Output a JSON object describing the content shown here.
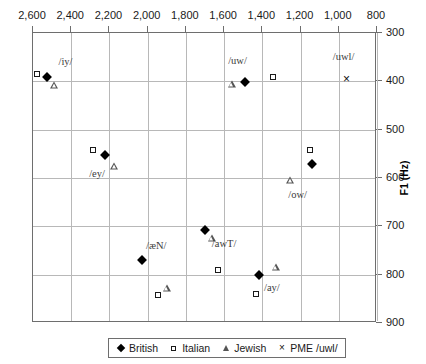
{
  "chart_data": {
    "type": "scatter",
    "title": "",
    "xlabel": "",
    "ylabel": "F1 (Hz)",
    "xlim": [
      2600,
      800
    ],
    "ylim": [
      300,
      900
    ],
    "x_ticks": [
      "2,600",
      "2,400",
      "2,200",
      "2,000",
      "1,800",
      "1,600",
      "1,400",
      "1,200",
      "1,000",
      "800"
    ],
    "x_tick_values": [
      2600,
      2400,
      2200,
      2000,
      1800,
      1600,
      1400,
      1200,
      1000,
      800
    ],
    "y_ticks": [
      "300",
      "400",
      "500",
      "600",
      "700",
      "800",
      "900"
    ],
    "y_tick_values": [
      300,
      400,
      500,
      600,
      700,
      800,
      900
    ],
    "x_axis_position": "top",
    "y_axis_position": "right",
    "x_axis_reversed": true,
    "y_axis_reversed": true,
    "grid": true,
    "legend_position": "bottom",
    "series": [
      {
        "name": "British",
        "marker": "diamond",
        "points": [
          {
            "label": "/iy/",
            "x": 2525,
            "y": 392
          },
          {
            "label": "/ey/",
            "x": 2225,
            "y": 552
          },
          {
            "label": "/uw/",
            "x": 1490,
            "y": 402
          },
          {
            "label": "/ow/",
            "x": 1140,
            "y": 570
          },
          {
            "label": "/æN/",
            "x": 2030,
            "y": 770
          },
          {
            "label": "/awT/",
            "x": 1700,
            "y": 707
          },
          {
            "label": "/ay/",
            "x": 1415,
            "y": 800
          }
        ]
      },
      {
        "name": "Italian",
        "marker": "square",
        "points": [
          {
            "label": "/iy/",
            "x": 2580,
            "y": 385
          },
          {
            "label": "/ey/",
            "x": 2285,
            "y": 543
          },
          {
            "label": "/uw/",
            "x": 1345,
            "y": 390
          },
          {
            "label": "/ow/",
            "x": 1150,
            "y": 543
          },
          {
            "label": "/æN/",
            "x": 1945,
            "y": 843
          },
          {
            "label": "/awT/",
            "x": 1630,
            "y": 790
          },
          {
            "label": "/ay/",
            "x": 1435,
            "y": 840
          }
        ]
      },
      {
        "name": "Jewish",
        "marker": "triangle",
        "points": [
          {
            "label": "/iy/",
            "x": 2490,
            "y": 408
          },
          {
            "label": "/ey/",
            "x": 2175,
            "y": 575
          },
          {
            "label": "/uw/",
            "x": 1560,
            "y": 405
          },
          {
            "label": "/ow/",
            "x": 1255,
            "y": 605
          },
          {
            "label": "/æN/",
            "x": 1900,
            "y": 827
          },
          {
            "label": "/awT/",
            "x": 1665,
            "y": 725
          },
          {
            "label": "/ay/",
            "x": 1330,
            "y": 785
          }
        ]
      },
      {
        "name": "PME /uwl/",
        "marker": "cross",
        "points": [
          {
            "label": "/uwl/",
            "x": 960,
            "y": 395
          }
        ]
      }
    ],
    "annotations": [
      {
        "text": "/iy/",
        "x": 2430,
        "y": 358
      },
      {
        "text": "/ey/",
        "x": 2265,
        "y": 590
      },
      {
        "text": "/uw/",
        "x": 1530,
        "y": 355
      },
      {
        "text": "/uwl/",
        "x": 975,
        "y": 348
      },
      {
        "text": "/ow/",
        "x": 1215,
        "y": 633
      },
      {
        "text": "/æN/",
        "x": 1955,
        "y": 738
      },
      {
        "text": "/awT/",
        "x": 1600,
        "y": 735
      },
      {
        "text": "/ay/",
        "x": 1350,
        "y": 825
      }
    ]
  },
  "legend": {
    "items": [
      {
        "label": "British",
        "marker": "diamond-marker-icon"
      },
      {
        "label": "Italian",
        "marker": "square-marker-icon"
      },
      {
        "label": "Jewish",
        "marker": "triangle-marker-icon"
      },
      {
        "label": "PME /uwl/",
        "marker": "cross-marker-icon"
      }
    ]
  }
}
